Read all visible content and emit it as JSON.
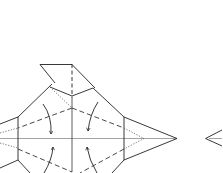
{
  "diagram": {
    "type": "origami-fold-diagram",
    "colors": {
      "line": "#222222",
      "valley": "#333333",
      "hidden": "#555555",
      "center": "#888888",
      "background": "#ffffff"
    },
    "steps": [
      {
        "name": "current-step",
        "description": "Fold the four flaps inward along dashed valley lines (arrows)"
      },
      {
        "name": "next-step-partial",
        "description": "Partially visible next step at right edge"
      }
    ],
    "arrows": [
      {
        "name": "fold-arrow-top-left",
        "direction": "down"
      },
      {
        "name": "fold-arrow-top-right",
        "direction": "down"
      },
      {
        "name": "fold-arrow-bottom-left",
        "direction": "up"
      },
      {
        "name": "fold-arrow-bottom-right",
        "direction": "up"
      }
    ]
  }
}
